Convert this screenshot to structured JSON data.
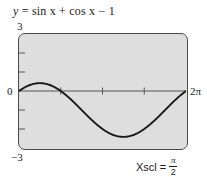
{
  "figure": {
    "equation": {
      "lhs": "y",
      "eq": " = ",
      "rhs": "sin x + cos x − 1",
      "full": "y = sin x + cos x − 1"
    },
    "labels": {
      "ymax": "3",
      "ymin": "−3",
      "origin": "0",
      "xmax": "2π"
    },
    "annotation": {
      "name": "Xscl",
      "equals": "=",
      "numerator": "π",
      "denominator": "2",
      "full": "Xscl = π/2"
    },
    "colors": {
      "plot_background": "#dedede",
      "frame_stroke": "#4a4a4a",
      "curve": "#1a1a1a",
      "axis": "#555555",
      "page_background": "#ffffff"
    }
  },
  "chart_data": {
    "type": "line",
    "title": "y = sin x + cos x − 1",
    "xlabel": "",
    "ylabel": "",
    "xlim": [
      0,
      6.283185307179586
    ],
    "ylim": [
      -3,
      3
    ],
    "xscl": 1.5707963267948966,
    "yscl": 1,
    "grid": false,
    "legend": null,
    "xtick_labels": [
      "0",
      "2π"
    ],
    "ytick_labels": [
      "3",
      "−3"
    ],
    "series": [
      {
        "name": "y = sin x + cos x − 1",
        "x": [
          0,
          0.2618,
          0.5236,
          0.7854,
          1.0472,
          1.309,
          1.5708,
          1.8326,
          2.0944,
          2.3562,
          2.618,
          2.8798,
          3.1416,
          3.4034,
          3.6652,
          3.927,
          4.1888,
          4.4506,
          4.7124,
          4.9742,
          5.236,
          5.4978,
          5.7596,
          6.0214,
          6.2832
        ],
        "y": [
          0,
          0.2247,
          0.366,
          0.4142,
          0.366,
          0.2247,
          0,
          -0.2753,
          -0.634,
          -1.0,
          -1.366,
          -1.6906,
          -1.9319,
          -2.0706,
          -2.1042,
          -2.0,
          -1.866,
          -1.6906,
          -1.4142,
          -1.0706,
          -0.634,
          -0.2247,
          0.1,
          0.2247,
          0
        ],
        "max_value": 0.4142,
        "min_value": -2.4142,
        "zero_crossings": [
          "0",
          "π/2",
          "2π"
        ]
      }
    ]
  }
}
